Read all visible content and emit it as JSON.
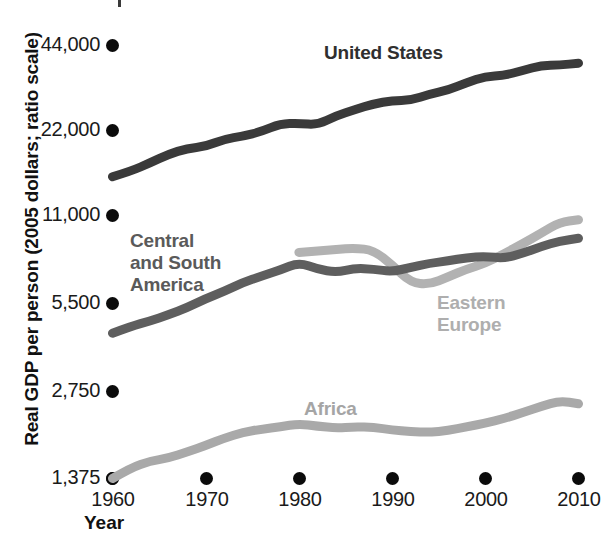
{
  "axes": {
    "ylabel": "Real GDP per person (2005 dollars; ratio scale)",
    "xlabel": "Year",
    "yticks": [
      "44,000",
      "22,000",
      "11,000",
      "5,500",
      "2,750",
      "1,375"
    ],
    "xticks": [
      "1960",
      "1970",
      "1980",
      "1990",
      "2000",
      "2010"
    ]
  },
  "series_labels": {
    "united_states": "United States",
    "central_south_america": "Central\nand South\nAmerica",
    "central_south_america_l1": "Central",
    "central_south_america_l2": "and South",
    "central_south_america_l3": "America",
    "eastern_europe_l1": "Eastern",
    "eastern_europe_l2": "Europe",
    "africa": "Africa"
  },
  "colors": {
    "united_states": "#3a3a3a",
    "central_south_america": "#5e5e5e",
    "eastern_europe": "#b2b2b2",
    "africa": "#a9a9a9",
    "tick": "#0b0b0b",
    "text": "#1a1a1a"
  },
  "chart_data": {
    "type": "line",
    "title": "",
    "xlabel": "Year",
    "ylabel": "Real GDP per person (2005 dollars; ratio scale)",
    "yscale": "log",
    "ylim": [
      1375,
      44000
    ],
    "xlim": [
      1960,
      2010
    ],
    "grid": false,
    "legend": "inline-labels",
    "ytick_values": [
      44000,
      22000,
      11000,
      5500,
      2750,
      1375
    ],
    "xtick_values": [
      1960,
      1970,
      1980,
      1990,
      2000,
      2010
    ],
    "x": [
      1960,
      1962,
      1964,
      1966,
      1968,
      1970,
      1972,
      1974,
      1976,
      1978,
      1980,
      1982,
      1984,
      1986,
      1988,
      1990,
      1992,
      1994,
      1996,
      1998,
      2000,
      2002,
      2004,
      2006,
      2008,
      2010
    ],
    "series": [
      {
        "name": "United States",
        "color": "#3a3a3a",
        "values": [
          15400,
          16100,
          17200,
          18400,
          19300,
          19600,
          20800,
          21300,
          22100,
          23500,
          23600,
          23300,
          25100,
          26300,
          27600,
          28300,
          28400,
          29800,
          30800,
          32700,
          34400,
          34600,
          36000,
          37500,
          37600,
          38200
        ]
      },
      {
        "name": "Central and South America",
        "color": "#5e5e5e",
        "values": [
          4400,
          4650,
          4850,
          5100,
          5400,
          5800,
          6150,
          6600,
          6950,
          7300,
          7750,
          7350,
          7150,
          7400,
          7350,
          7200,
          7450,
          7700,
          7850,
          8050,
          8150,
          8000,
          8350,
          8800,
          9200,
          9400
        ]
      },
      {
        "name": "Eastern Europe",
        "color": "#b2b2b2",
        "values": [
          null,
          null,
          null,
          null,
          null,
          null,
          null,
          null,
          null,
          null,
          8400,
          8500,
          8600,
          8700,
          8550,
          7600,
          6600,
          6500,
          6900,
          7350,
          7700,
          8300,
          9000,
          9800,
          10700,
          10900
        ]
      },
      {
        "name": "Africa",
        "color": "#a9a9a9",
        "values": [
          1375,
          1500,
          1580,
          1620,
          1700,
          1790,
          1900,
          1990,
          2040,
          2080,
          2130,
          2090,
          2060,
          2080,
          2070,
          2030,
          2000,
          1990,
          2020,
          2080,
          2140,
          2220,
          2330,
          2450,
          2560,
          2500
        ]
      }
    ]
  }
}
